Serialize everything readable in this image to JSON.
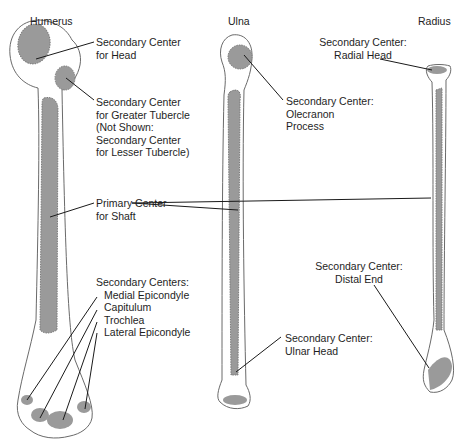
{
  "colors": {
    "bone_fill": "#ffffff",
    "bone_outline": "#6a6a6a",
    "ossification_center": "#9a9a9a",
    "leader_line": "#1a1a1a"
  },
  "bones": {
    "humerus": {
      "title": "Humerus"
    },
    "ulna": {
      "title": "Ulna"
    },
    "radius": {
      "title": "Radius"
    }
  },
  "labels": {
    "humerus_head": [
      "Secondary Center",
      "for Head"
    ],
    "greater_tubercle": [
      "Secondary Center",
      "for Greater Tubercle",
      "(Not Shown:",
      "Secondary Center",
      "for Lesser Tubercle)"
    ],
    "primary_shaft": [
      "Primary Center",
      "for Shaft"
    ],
    "humerus_distal": [
      "Secondary Centers:",
      "Medial Epicondyle",
      "Capitulum",
      "Trochlea",
      "Lateral Epicondyle"
    ],
    "olecranon": [
      "Secondary Center:",
      "Olecranon",
      "Process"
    ],
    "ulnar_head": [
      "Secondary Center:",
      "Ulnar Head"
    ],
    "radial_head": [
      "Secondary Center:",
      "Radial Head"
    ],
    "radius_distal": [
      "Secondary Center:",
      "Distal End"
    ]
  }
}
